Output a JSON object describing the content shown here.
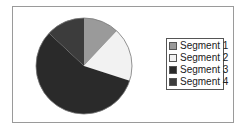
{
  "chart_data": {
    "type": "pie",
    "title": "",
    "categories": [
      "Segment 1",
      "Segment 2",
      "Segment 3",
      "Segment 4"
    ],
    "values": [
      12,
      18,
      57,
      13
    ],
    "unit": "percent (estimated)",
    "colors": [
      "#9a9a9a",
      "#f2f2f2",
      "#2a2a2a",
      "#3c3c3c"
    ],
    "start_angle_deg": 0,
    "direction": "clockwise",
    "legend_position": "right"
  },
  "legend": {
    "items": [
      {
        "label": "Segment 1",
        "color": "#9a9a9a"
      },
      {
        "label": "Segment 2",
        "color": "#f2f2f2"
      },
      {
        "label": "Segment 3",
        "color": "#2a2a2a"
      },
      {
        "label": "Segment 4",
        "color": "#3c3c3c"
      }
    ]
  }
}
